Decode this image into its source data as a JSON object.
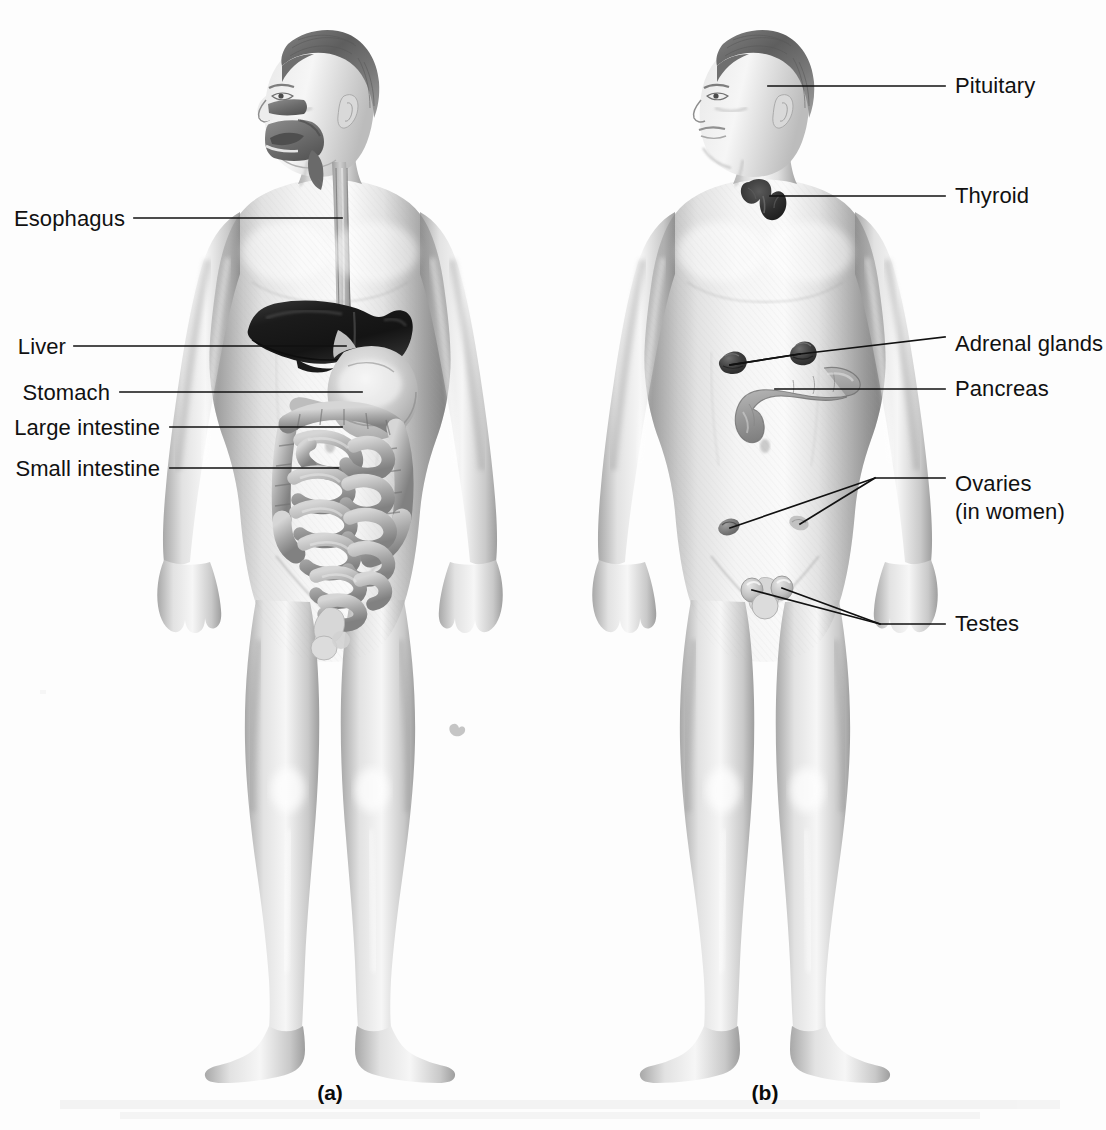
{
  "figure": {
    "background_color": "#fdfdfd",
    "ink_color": "#111111",
    "width": 1106,
    "height": 1130
  },
  "panels": [
    {
      "id": "a",
      "caption": "(a)",
      "caption_x": 330,
      "caption_y": 1100,
      "subject": "digestive-system-figure",
      "label_side": "left",
      "labels": [
        {
          "text": "Esophagus",
          "name": "label-esophagus",
          "text_x": 125,
          "text_y": 226,
          "line": [
            [
              134,
              218
            ],
            [
              342,
              218
            ]
          ]
        },
        {
          "text": "Liver",
          "name": "label-liver",
          "text_x": 66,
          "text_y": 354,
          "line": [
            [
              74,
              346
            ],
            [
              346,
              346
            ]
          ]
        },
        {
          "text": "Stomach",
          "name": "label-stomach",
          "text_x": 110,
          "text_y": 400,
          "line": [
            [
              120,
              392
            ],
            [
              362,
              392
            ]
          ]
        },
        {
          "text": "Large intestine",
          "name": "label-large-intestine",
          "text_x": 160,
          "text_y": 435,
          "line": [
            [
              170,
              427
            ],
            [
              342,
              427
            ]
          ]
        },
        {
          "text": "Small intestine",
          "name": "label-small-intestine",
          "text_x": 160,
          "text_y": 476,
          "line": [
            [
              170,
              468
            ],
            [
              338,
              468
            ]
          ]
        }
      ]
    },
    {
      "id": "b",
      "caption": "(b)",
      "caption_x": 765,
      "caption_y": 1100,
      "subject": "endocrine-system-figure",
      "label_side": "right",
      "labels": [
        {
          "text": "Pituitary",
          "name": "label-pituitary",
          "text_x": 955,
          "text_y": 93,
          "line": [
            [
              768,
              86
            ],
            [
              945,
              86
            ]
          ]
        },
        {
          "text": "Thyroid",
          "name": "label-thyroid",
          "text_x": 955,
          "text_y": 203,
          "line": [
            [
              770,
              196
            ],
            [
              945,
              196
            ]
          ]
        },
        {
          "text": "Adrenal glands",
          "name": "label-adrenal-glands",
          "text_x": 955,
          "text_y": 351,
          "line": [
            [
              730,
              365
            ],
            [
              800,
              354
            ],
            [
              945,
              337
            ]
          ],
          "branch": [
            [
              800,
              354
            ],
            [
              730,
              365
            ]
          ]
        },
        {
          "text": "Pancreas",
          "name": "label-pancreas",
          "text_x": 955,
          "text_y": 396,
          "line": [
            [
              775,
              389
            ],
            [
              945,
              389
            ]
          ]
        },
        {
          "text": "Ovaries",
          "name": "label-ovaries",
          "text_x": 955,
          "text_y": 491,
          "line": [
            [
              730,
              528
            ],
            [
              875,
              478
            ],
            [
              945,
              478
            ]
          ],
          "branch": [
            [
              875,
              478
            ],
            [
              800,
              524
            ]
          ]
        },
        {
          "text": "(in women)",
          "name": "label-ovaries-note",
          "text_x": 955,
          "text_y": 519
        },
        {
          "text": "Testes",
          "name": "label-testes",
          "text_x": 955,
          "text_y": 631,
          "line": [
            [
              752,
              590
            ],
            [
              880,
              624
            ],
            [
              945,
              624
            ]
          ],
          "branch": [
            [
              880,
              624
            ],
            [
              782,
              588
            ]
          ]
        }
      ]
    }
  ],
  "ghost_artifacts": [
    {
      "x": 455,
      "y": 728,
      "name": "scan-speck"
    }
  ]
}
